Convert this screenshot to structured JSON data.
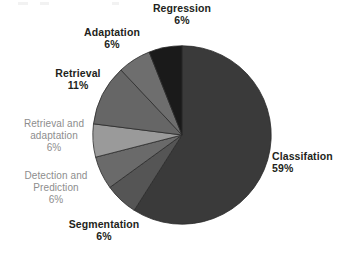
{
  "chart_data": {
    "type": "pie",
    "title": "",
    "subtitle": "",
    "xlabel": "",
    "ylabel": "",
    "legend_position": "none",
    "grid": false,
    "label_format": "name + percent",
    "start_angle_deg": 0,
    "direction": "clockwise",
    "categories": [
      "Classifation",
      "Segmentation",
      "Detection and Prediction",
      "Retrieval and adaptation",
      "Retrieval",
      "Adaptation",
      "Regression"
    ],
    "values": [
      59,
      6,
      6,
      6,
      11,
      6,
      6
    ],
    "units": "percent",
    "total": 100,
    "slices": [
      {
        "name": "Classifation",
        "line1": "Classifation",
        "percent_text": "59%",
        "value": 59,
        "color": "#3a3a3a",
        "label_style": "strong"
      },
      {
        "name": "Segmentation",
        "line1": "Segmentation",
        "percent_text": "6%",
        "value": 6,
        "color": "#555555",
        "label_style": "strong"
      },
      {
        "name": "Detection and Prediction",
        "line1": "Detection and",
        "line2": "Prediction",
        "percent_text": "6%",
        "value": 6,
        "color": "#6a6a6a",
        "label_style": "soft"
      },
      {
        "name": "Retrieval and adaptation",
        "line1": "Retrieval and",
        "line2": "adaptation",
        "percent_text": "6%",
        "value": 6,
        "color": "#9a9a9a",
        "label_style": "soft"
      },
      {
        "name": "Retrieval",
        "line1": "Retrieval",
        "percent_text": "11%",
        "value": 11,
        "color": "#666666",
        "label_style": "strong"
      },
      {
        "name": "Adaptation",
        "line1": "Adaptation",
        "percent_text": "6%",
        "value": 6,
        "color": "#6e6e6e",
        "label_style": "strong"
      },
      {
        "name": "Regression",
        "line1": "Regression",
        "percent_text": "6%",
        "value": 6,
        "color": "#1a1a1a",
        "label_style": "strong"
      }
    ],
    "colors": {
      "background": "#ffffff",
      "label_strong": "#231f20",
      "label_soft": "#8d8d8d",
      "slice_border": "#2b2b2b"
    }
  }
}
